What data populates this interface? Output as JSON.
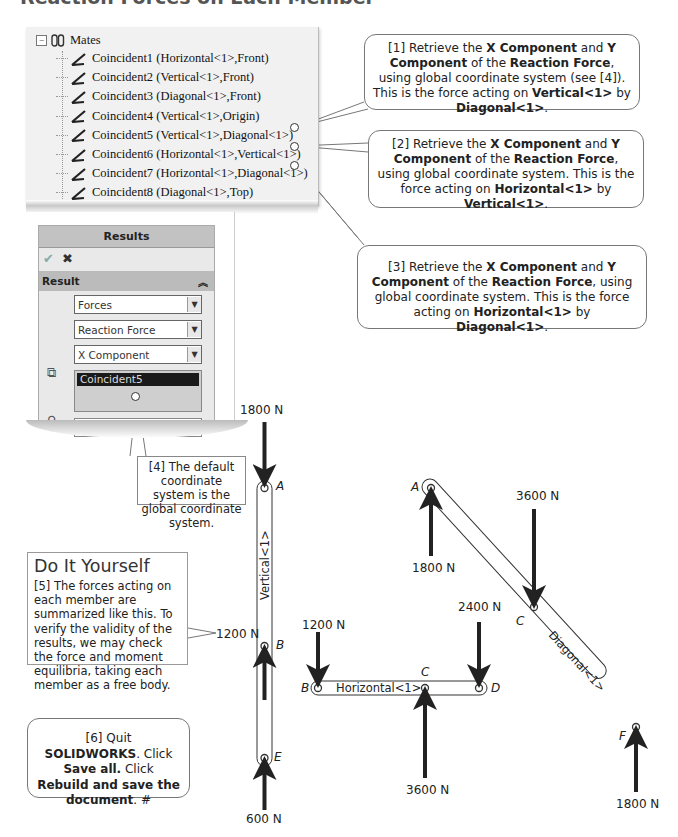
{
  "page": {
    "heading": "Reaction Forces on Each Member"
  },
  "mates_tree": {
    "root_label": "Mates",
    "items": [
      {
        "label": "Coincident1 (Horizontal<1>,Front)"
      },
      {
        "label": "Coincident2 (Vertical<1>,Front)"
      },
      {
        "label": "Coincident3 (Diagonal<1>,Front)"
      },
      {
        "label": "Coincident4 (Vertical<1>,Origin)"
      },
      {
        "label": "Coincident5 (Vertical<1>,Diagonal<1>)"
      },
      {
        "label": "Coincident6 (Horizontal<1>,Vertical<1>)"
      },
      {
        "label": "Coincident7 (Horizontal<1>,Diagonal<1>)"
      },
      {
        "label": "Coincident8 (Diagonal<1>,Top)"
      }
    ]
  },
  "results_panel": {
    "title": "Results",
    "ok_icon": "check-icon",
    "cancel_icon": "x-icon",
    "section_label": "Result",
    "collapse_icon": "double-chevron-up-icon",
    "dropdown_type": "Forces",
    "dropdown_force": "Reaction Force",
    "dropdown_component": "X Component",
    "selected_entity": "Coincident5",
    "coordinate_field": ""
  },
  "callouts": {
    "c1": {
      "num": "[1]",
      "t1": " Retrieve the ",
      "b1": "X Component",
      "t2": " and ",
      "b2": "Y Component",
      "t3": " of the ",
      "b3": "Reaction Force",
      "t4": ", using global coordinate system (see [4]). This is the force acting on ",
      "b4": "Vertical<1>",
      "t5": " by ",
      "b5": "Diagonal<1>",
      "t6": "."
    },
    "c2": {
      "num": "[2]",
      "t1": " Retrieve the ",
      "b1": "X Component",
      "t2": " and ",
      "b2": "Y Component",
      "t3": " of the ",
      "b3": "Reaction Force",
      "t4": ", using global coordinate system. This is the force acting on ",
      "b4": "Horizontal<1>",
      "t5": " by ",
      "b5": "Vertical<1>",
      "t6": "."
    },
    "c3": {
      "num": "[3]",
      "t1": " Retrieve the ",
      "b1": "X Component",
      "t2": " and ",
      "b2": "Y Component",
      "t3": " of the ",
      "b3": "Reaction Force",
      "t4": ", using global coordinate system.  This is the force acting on ",
      "b4": "Horizontal<1>",
      "t5": " by ",
      "b5": "Diagonal<1>",
      "t6": "."
    },
    "c4": {
      "text": "[4] The default coordinate system is the global coordinate system."
    },
    "c5": {
      "title": "Do It Yourself",
      "text": "[5] The forces acting on each member are summarized like this. To verify the validity of the results, we may check the force and moment equilibria, taking each member as a free body."
    },
    "c6": {
      "num": "[6]",
      "t1": " Quit ",
      "b1": "SOLIDWORKS",
      "t2": ". Click ",
      "b2": "Save all.",
      "t3": "  Click ",
      "b3": "Rebuild and save the document",
      "t4": ". #"
    }
  },
  "diagram": {
    "members": {
      "vertical": "Vertical<1>",
      "horizontal": "Horizontal<1>",
      "diagonal": "Diagonal<1>"
    },
    "points": {
      "A": "A",
      "B": "B",
      "C": "C",
      "D": "D",
      "E": "E",
      "F": "F"
    },
    "forces": {
      "vertical_A": "1800 N",
      "vertical_B": "1200 N",
      "vertical_E": "600 N",
      "horizontal_B": "1200 N",
      "horizontal_D": "2400 N",
      "horizontal_C": "3600 N",
      "diagonal_A": "1800 N",
      "diagonal_C": "3600 N",
      "diagonal_F": "1800 N"
    }
  }
}
